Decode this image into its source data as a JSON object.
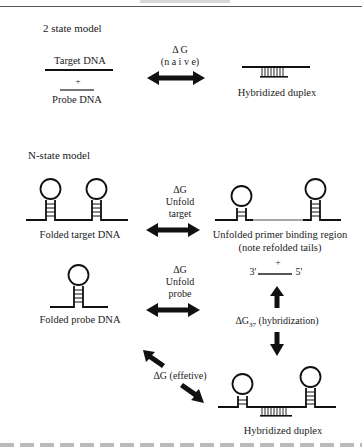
{
  "two_state": {
    "title": "2 state model",
    "target_label": "Target DNA",
    "plus": "+",
    "probe_label": "Probe DNA",
    "dg_label": "Δ G",
    "dg_sub": "(n a i v e)",
    "duplex_label": "Hybridized duplex"
  },
  "n_state": {
    "title": "N-state model",
    "folded_target_label": "Folded target DNA",
    "unfold_target": {
      "dg": "ΔG",
      "line1": "Unfold",
      "line2": "target"
    },
    "unfolded_region_label_1": "Unfolded primer binding region",
    "unfolded_region_label_2": "(note refolded tails)",
    "folded_probe_label": "Folded probe DNA",
    "unfold_probe": {
      "dg": "ΔG",
      "line1": "Unfold",
      "line2": "probe"
    },
    "probe_strand": {
      "plus": "+",
      "end3": "3'",
      "end5": "5'"
    },
    "hybridization_label": "ΔG",
    "hybridization_sub": "37",
    "hybridization_suffix": " (hybridization)",
    "effective_label": "ΔG (effetive)",
    "final_duplex_label": "Hybridized duplex"
  },
  "colors": {
    "ink": "#111111",
    "probe_gray": "#777777",
    "background": "#ffffff"
  }
}
